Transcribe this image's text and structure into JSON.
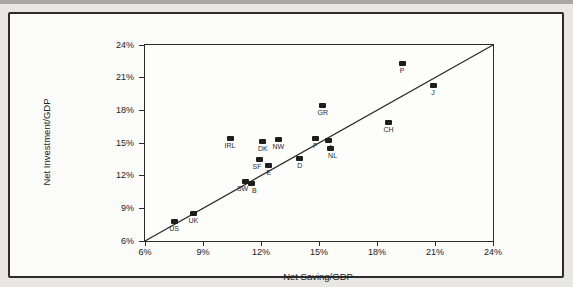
{
  "chart_data": {
    "type": "scatter",
    "title": "",
    "xlabel": "Net Saving/GDP",
    "ylabel": "Net Investment/GDP",
    "xlim": [
      6,
      24
    ],
    "ylim": [
      6,
      24
    ],
    "x_tick_labels": [
      "6%",
      "9%",
      "12%",
      "15%",
      "18%",
      "21%",
      "24%"
    ],
    "y_tick_labels": [
      "6%",
      "9%",
      "12%",
      "15%",
      "18%",
      "21%",
      "24%"
    ],
    "grid": false,
    "legend": "none",
    "marker": {
      "shape": "square",
      "color": "#1e1e1e"
    },
    "reference_line": {
      "type": "45-degree line",
      "x1": 6,
      "y1": 6,
      "x2": 24,
      "y2": 24,
      "color": "#2b2b2b"
    },
    "points": [
      {
        "label": "US",
        "saving": 7.5,
        "investment": 7.8
      },
      {
        "label": "UK",
        "saving": 8.5,
        "investment": 8.5
      },
      {
        "label": "IRL",
        "saving": 10.4,
        "investment": 15.4
      },
      {
        "label": "SW",
        "saving": 11.2,
        "investment": 11.5,
        "label_dx": -3
      },
      {
        "label": "B",
        "saving": 11.5,
        "investment": 11.3,
        "label_dx": 3
      },
      {
        "label": "SF",
        "saving": 11.9,
        "investment": 13.5,
        "label_dx": -2
      },
      {
        "label": "DK",
        "saving": 12.1,
        "investment": 15.1
      },
      {
        "label": "E",
        "saving": 12.4,
        "investment": 12.9
      },
      {
        "label": "NW",
        "saving": 12.9,
        "investment": 15.3
      },
      {
        "label": "D",
        "saving": 14.0,
        "investment": 13.6
      },
      {
        "label": "F",
        "saving": 14.8,
        "investment": 15.4
      },
      {
        "label": "GR",
        "saving": 15.2,
        "investment": 18.4
      },
      {
        "label": "A",
        "saving": 15.5,
        "investment": 15.2,
        "label_dx": 2
      },
      {
        "label": "NL",
        "saving": 15.6,
        "investment": 14.5,
        "label_dx": 2
      },
      {
        "label": "CH",
        "saving": 18.6,
        "investment": 16.9
      },
      {
        "label": "P",
        "saving": 19.3,
        "investment": 22.3
      },
      {
        "label": "J",
        "saving": 20.9,
        "investment": 20.3
      }
    ]
  }
}
